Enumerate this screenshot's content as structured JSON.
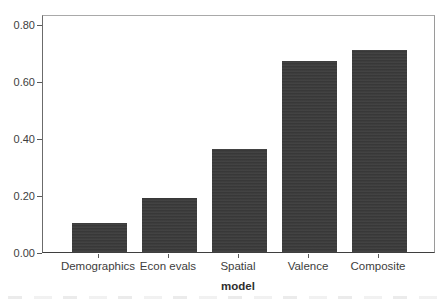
{
  "chart_data": {
    "type": "bar",
    "title": "",
    "categories": [
      "Demographics",
      "Econ evals",
      "Spatial",
      "Valence",
      "Composite"
    ],
    "values": [
      0.1,
      0.19,
      0.36,
      0.67,
      0.71
    ],
    "xlabel": "model",
    "ylabel": "",
    "ylim": [
      0,
      0.835
    ],
    "yticks": [
      "0.00",
      "0.20",
      "0.40",
      "0.60",
      "0.80"
    ],
    "grid": false,
    "legend": "none",
    "bar_color": "#3b3b3b",
    "axis_color": "#5a5a5a",
    "box_color": "#9a9a9a",
    "text_color": "#3d3d3d",
    "background_color": "#ffffff"
  }
}
